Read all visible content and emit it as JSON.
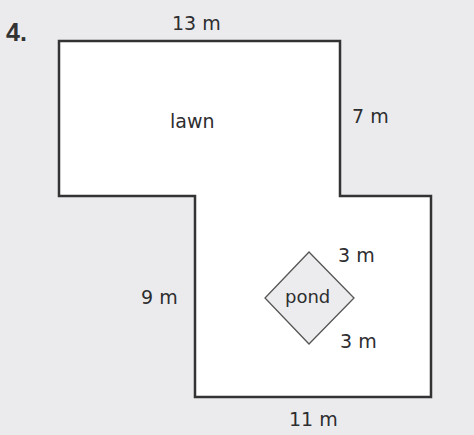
{
  "problem_number": "4.",
  "shape": {
    "fill": "#ffffff",
    "stroke": "#333333",
    "points": [
      [
        59,
        41
      ],
      [
        340,
        41
      ],
      [
        340,
        196
      ],
      [
        431,
        196
      ],
      [
        431,
        397
      ],
      [
        195,
        397
      ],
      [
        195,
        196
      ],
      [
        59,
        196
      ]
    ]
  },
  "pond": {
    "label": "pond",
    "stroke": "#555555",
    "fill": "#ececee",
    "points": [
      [
        309,
        252
      ],
      [
        354,
        298
      ],
      [
        309,
        344
      ],
      [
        265,
        298
      ]
    ]
  },
  "labels": {
    "lawn": "lawn",
    "top": "13 m",
    "right_upper": "7 m",
    "left_lower": "9 m",
    "pond_top": "3 m",
    "pond_bottom": "3 m",
    "bottom": "11 m"
  }
}
